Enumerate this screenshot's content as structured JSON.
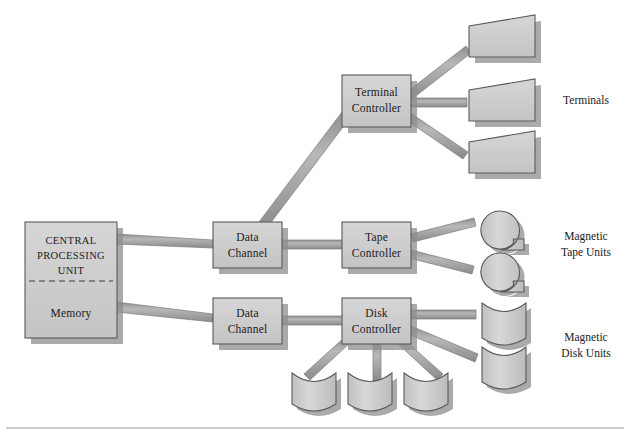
{
  "diagram": {
    "colors": {
      "shape_fill": "#cbcbcb",
      "shape_fill_light": "#d4d4d4",
      "shape_stroke": "#5a5a5a",
      "shadow": "#8e8e8e",
      "connector": "#a8a8a8",
      "connector_edge": "#6f6f6f",
      "text": "#1a1a1a",
      "rule": "#9a9a9a",
      "background": "#ffffff"
    },
    "nodes": {
      "cpu": {
        "line1": "CENTRAL",
        "line2": "PROCESSING",
        "line3": "UNIT",
        "memory": "Memory"
      },
      "data_channel_top": {
        "line1": "Data",
        "line2": "Channel"
      },
      "data_channel_bottom": {
        "line1": "Data",
        "line2": "Channel"
      },
      "terminal_controller": {
        "line1": "Terminal",
        "line2": "Controller"
      },
      "tape_controller": {
        "line1": "Tape",
        "line2": "Controller"
      },
      "disk_controller": {
        "line1": "Disk",
        "line2": "Controller"
      }
    },
    "group_labels": {
      "terminals": "Terminals",
      "magnetic_tape_1": "Magnetic",
      "magnetic_tape_2": "Tape Units",
      "magnetic_disk_1": "Magnetic",
      "magnetic_disk_2": "Disk Units"
    },
    "peripheral_counts": {
      "terminals": 3,
      "magnetic_tape_units": 2,
      "magnetic_disk_units": 5
    }
  }
}
